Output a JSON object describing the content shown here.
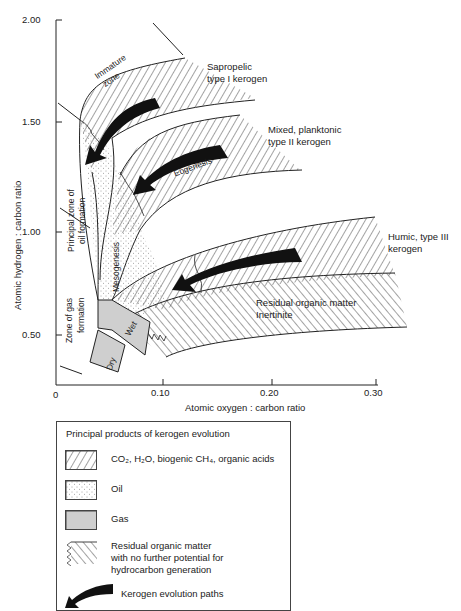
{
  "diagram": {
    "type": "van Krevelen diagram",
    "y_axis": {
      "label": "Atomic hydrogen : carbon ratio",
      "ticks": [
        "2.00",
        "1.50",
        "1.00",
        "0.50"
      ]
    },
    "x_axis": {
      "label": "Atomic oxygen : carbon ratio",
      "ticks": [
        "0",
        "0.10",
        "0.20",
        "0.30"
      ]
    },
    "regions": {
      "immature_zone": "Immature zone",
      "immature_zone_line1": "Immature",
      "immature_zone_line2": "zone",
      "eogenesis": "Eogenesis",
      "mesogenesis": "Mesogenesis",
      "principal_oil_line1": "Principal zone of",
      "principal_oil_line2": "oil formation",
      "gas_zone_line1": "Zone of gas",
      "gas_zone_line2": "formation",
      "wet": "Wet",
      "dry": "Dry"
    },
    "kerogen_types": {
      "type1_line1": "Sapropelic",
      "type1_line2": "type I kerogen",
      "type2_line1": "Mixed, planktonic",
      "type2_line2": "type II kerogen",
      "type3_line1": "Humic, type III",
      "type3_line2": "kerogen",
      "residual_line1": "Residual organic matter",
      "residual_line2": "Inertinite"
    }
  },
  "legend": {
    "title": "Principal products of kerogen evolution",
    "items": [
      {
        "pattern": "hatched",
        "label": "CO₂, H₂O, biogenic CH₄, organic acids"
      },
      {
        "pattern": "stippled",
        "label": "Oil"
      },
      {
        "pattern": "grey",
        "label": "Gas"
      },
      {
        "pattern": "residual-hatch",
        "label_line1": "Residual organic matter",
        "label_line2": "with no further potential for",
        "label_line3": "hydrocarbon generation"
      },
      {
        "pattern": "arrow",
        "label": "Kerogen evolution paths"
      }
    ]
  },
  "colors": {
    "line": "#222222",
    "gas_fill": "#cfcfcf",
    "background": "#ffffff"
  }
}
